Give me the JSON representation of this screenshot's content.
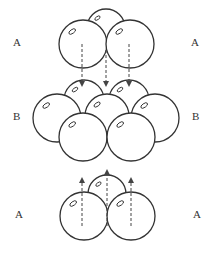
{
  "diagram": {
    "type": "ABA hexagonal close-packed layer stacking",
    "colors": {
      "stroke": "#333333",
      "fill": "#ffffff",
      "arrow": "#444444"
    },
    "labels": {
      "top_left": "A",
      "top_right": "A",
      "middle_left": "B",
      "middle_right": "B",
      "bottom_left": "A",
      "bottom_right": "A"
    },
    "layers": [
      {
        "name": "A",
        "position": "top",
        "spheres": [
          {
            "cx": 106,
            "cy": 28,
            "r": 19
          },
          {
            "cx": 83,
            "cy": 44,
            "r": 24
          },
          {
            "cx": 130,
            "cy": 44,
            "r": 24
          }
        ]
      },
      {
        "name": "B",
        "position": "middle",
        "spheres": [
          {
            "cx": 84,
            "cy": 100,
            "r": 20
          },
          {
            "cx": 129,
            "cy": 100,
            "r": 20
          },
          {
            "cx": 57,
            "cy": 118,
            "r": 24
          },
          {
            "cx": 107,
            "cy": 116,
            "r": 22
          },
          {
            "cx": 155,
            "cy": 118,
            "r": 24
          },
          {
            "cx": 83,
            "cy": 137,
            "r": 24
          },
          {
            "cx": 131,
            "cy": 137,
            "r": 24
          }
        ]
      },
      {
        "name": "A",
        "position": "bottom",
        "spheres": [
          {
            "cx": 107,
            "cy": 194,
            "r": 19
          },
          {
            "cx": 84,
            "cy": 216,
            "r": 24
          },
          {
            "cx": 131,
            "cy": 216,
            "r": 24
          }
        ]
      }
    ],
    "arrows": [
      {
        "x": 82,
        "y1": 44,
        "y2": 84,
        "direction": "down"
      },
      {
        "x": 106,
        "y1": 50,
        "y2": 84,
        "direction": "down"
      },
      {
        "x": 129,
        "y1": 44,
        "y2": 84,
        "direction": "down"
      },
      {
        "x": 82,
        "y1": 226,
        "y2": 180,
        "direction": "up"
      },
      {
        "x": 107,
        "y1": 226,
        "y2": 172,
        "direction": "up"
      },
      {
        "x": 131,
        "y1": 226,
        "y2": 180,
        "direction": "up"
      }
    ]
  }
}
